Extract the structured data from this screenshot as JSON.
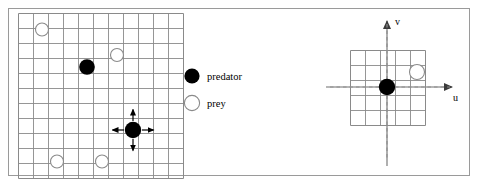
{
  "figure": {
    "title": "",
    "border": {
      "x": 8,
      "y": 8,
      "width": 462,
      "height": 168,
      "color": "#8c8c8c",
      "stroke_width": 1
    },
    "colors": {
      "predator_fill": "#000000",
      "prey_fill": "#ffffff",
      "prey_stroke": "#8a8a8a",
      "grid_line": "#8a8a8a",
      "grid_border": "#8a8a8a",
      "axis_line": "#6e6e6e",
      "dashed_axis": "#8a8a8a",
      "arrow": "#000000",
      "text": "#000000",
      "background": "#ffffff"
    }
  },
  "left_panel": {
    "name": "world-grid",
    "grid": {
      "origin_x": 18,
      "origin_y": 13,
      "cell_size": 15,
      "cols": 11,
      "rows": 11,
      "line_color": "#8a8a8a"
    },
    "agents": [
      {
        "type": "predator",
        "label": "predator",
        "col": 4.6,
        "row": 3.6,
        "radius": 7.5,
        "moving": false
      },
      {
        "type": "predator",
        "label": "predator",
        "col": 7.6,
        "row": 7.6,
        "radius": 8.0,
        "moving": true
      },
      {
        "type": "prey",
        "label": "prey",
        "col": 1.6,
        "row": 1.1,
        "radius": 6.5
      },
      {
        "type": "prey",
        "label": "prey",
        "col": 6.6,
        "row": 2.8,
        "radius": 6.5
      },
      {
        "type": "prey",
        "label": "prey",
        "col": 2.6,
        "row": 9.9,
        "radius": 6.5
      },
      {
        "type": "prey",
        "label": "prey",
        "col": 5.6,
        "row": 9.9,
        "radius": 6.5
      }
    ],
    "move_arrows": {
      "directions": [
        "up",
        "down",
        "left",
        "right"
      ],
      "length": 14,
      "color": "#000000"
    }
  },
  "legend": {
    "name": "agent-legend",
    "x": 196,
    "items": [
      {
        "key": "predator",
        "label": "predator",
        "marker": "filled-circle",
        "marker_x": 192,
        "marker_y": 76,
        "radius": 7.5,
        "text_x": 206,
        "text_y": 80
      },
      {
        "key": "prey",
        "label": "prey",
        "marker": "open-circle",
        "marker_x": 192,
        "marker_y": 103,
        "radius": 7.5,
        "text_x": 206,
        "text_y": 107
      }
    ]
  },
  "right_panel": {
    "name": "local-uv-frame",
    "grid": {
      "origin_x": 350,
      "origin_y": 50,
      "cell_size": 15,
      "cols": 5,
      "rows": 5,
      "line_color": "#8a8a8a"
    },
    "axes": [
      {
        "name": "u-axis",
        "label": "u",
        "orientation": "horizontal",
        "x1": 326,
        "y1": 87,
        "x2": 456,
        "y2": 87,
        "label_x": 456,
        "label_y": 100,
        "arrow": "right"
      },
      {
        "name": "v-axis",
        "label": "v",
        "orientation": "vertical",
        "x1": 387,
        "y1": 165,
        "x2": 387,
        "y2": 17,
        "label_x": 396,
        "label_y": 24,
        "arrow": "up"
      }
    ],
    "dashed_guides": [
      {
        "name": "u-dashed-guide",
        "x1": 326,
        "y1": 87,
        "x2": 456,
        "y2": 87
      },
      {
        "name": "v-dashed-guide",
        "x1": 387,
        "y1": 20,
        "x2": 387,
        "y2": 160
      }
    ],
    "agents": [
      {
        "type": "predator",
        "label": "predator",
        "cx": 387,
        "cy": 87,
        "radius": 8.0
      },
      {
        "type": "prey",
        "label": "prey",
        "cx": 416,
        "cy": 72,
        "radius": 7.5
      }
    ]
  },
  "chart_data": {
    "type": "diagram",
    "title": "",
    "panels": [
      {
        "name": "global-grid",
        "grid_size": [
          11,
          11
        ],
        "entities": [
          {
            "type": "predator",
            "cell": [
              4,
              3
            ],
            "selected": false
          },
          {
            "type": "predator",
            "cell": [
              7,
              7
            ],
            "selected": true,
            "actions": [
              "up",
              "down",
              "left",
              "right"
            ]
          },
          {
            "type": "prey",
            "cell": [
              1,
              1
            ]
          },
          {
            "type": "prey",
            "cell": [
              6,
              2
            ]
          },
          {
            "type": "prey",
            "cell": [
              2,
              9
            ]
          },
          {
            "type": "prey",
            "cell": [
              5,
              9
            ]
          }
        ]
      },
      {
        "name": "local-frame",
        "grid_size": [
          5,
          5
        ],
        "axes": [
          "u",
          "v"
        ],
        "entities": [
          {
            "type": "predator",
            "uv": [
              0,
              0
            ]
          },
          {
            "type": "prey",
            "uv": [
              2,
              1
            ]
          }
        ]
      }
    ],
    "legend_entries": [
      "predator",
      "prey"
    ]
  }
}
